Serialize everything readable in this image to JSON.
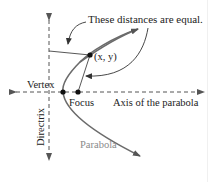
{
  "diagram": {
    "annotation": "These distances are equal.",
    "point_label": "(x, y)",
    "vertex_label": "Vertex",
    "focus_label": "Focus",
    "axis_label": "Axis of the parabola",
    "directrix_label": "Directrix",
    "parabola_label": "Parabola"
  },
  "colors": {
    "line": "#333333",
    "parabola": "#6b6b6b",
    "parabola_label": "#8a8a8a",
    "text": "#222222"
  }
}
